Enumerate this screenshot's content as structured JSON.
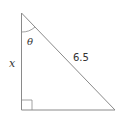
{
  "diagram": {
    "type": "right-triangle",
    "labels": {
      "angle": "θ",
      "vertical_side": "x",
      "hypotenuse": "6.5"
    },
    "colors": {
      "stroke": "#8a8a8a",
      "text": "#333333",
      "background": "#ffffff"
    }
  }
}
